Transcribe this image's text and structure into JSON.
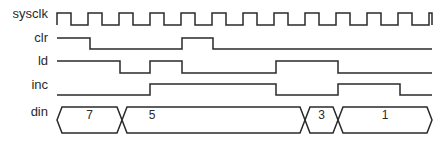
{
  "diagram": {
    "type": "timing-diagram",
    "signals": [
      {
        "name": "sysclk",
        "kind": "clock",
        "label_y": 13,
        "y_high": 13,
        "y_low": 25,
        "start_x": 57,
        "end_x": 432,
        "period": 31,
        "high_width": 14
      },
      {
        "name": "clr",
        "kind": "digital",
        "label_y": 37,
        "y_high": 38,
        "y_low": 49,
        "start_x": 57,
        "end_x": 432,
        "initial": 1,
        "edges": [
          90,
          182,
          213
        ]
      },
      {
        "name": "ld",
        "kind": "digital",
        "label_y": 60,
        "y_high": 61,
        "y_low": 73,
        "start_x": 57,
        "end_x": 432,
        "initial": 1,
        "edges": [
          120,
          150,
          182,
          276,
          338
        ]
      },
      {
        "name": "inc",
        "kind": "digital",
        "label_y": 84,
        "y_high": 84,
        "y_low": 95,
        "start_x": 57,
        "end_x": 432,
        "initial": 0,
        "edges": [
          150,
          276,
          338,
          400
        ]
      },
      {
        "name": "din",
        "kind": "bus",
        "label_y": 110,
        "y_top": 107,
        "y_bottom": 133,
        "start_x": 57,
        "end_x": 432,
        "segments": [
          {
            "value": "7",
            "from": 57,
            "to": 122
          },
          {
            "value": "5",
            "from": 122,
            "to": 305
          },
          {
            "value": "3",
            "from": 305,
            "to": 338
          },
          {
            "value": "1",
            "from": 338,
            "to": 432
          }
        ]
      }
    ]
  },
  "labels": {
    "sysclk": "sysclk",
    "clr": "clr",
    "ld": "ld",
    "inc": "inc",
    "din": "din"
  },
  "colors": {
    "line": "#2a2a2a",
    "background": "#ffffff"
  }
}
